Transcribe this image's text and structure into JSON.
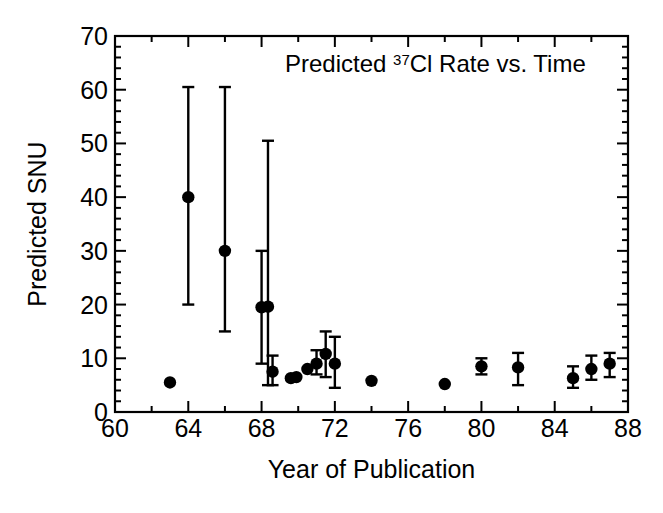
{
  "figure": {
    "title_prefix": "Predicted ",
    "title_sup": "37",
    "title_suffix": "Cl Rate vs. Time",
    "xlabel": "Year of Publication",
    "ylabel": "Predicted SNU",
    "ink_color": "#000000",
    "background_color": "#ffffff"
  },
  "chart_data": {
    "type": "scatter",
    "title": "Predicted 37Cl Rate vs. Time",
    "xlabel": "Year of Publication",
    "ylabel": "Predicted SNU",
    "xlim": [
      60,
      88
    ],
    "ylim": [
      0,
      70
    ],
    "xticks": [
      60,
      62,
      64,
      66,
      68,
      70,
      72,
      74,
      76,
      78,
      80,
      82,
      84,
      86,
      88
    ],
    "xtick_labels": [
      "60",
      "",
      "64",
      "",
      "68",
      "",
      "72",
      "",
      "76",
      "",
      "80",
      "",
      "84",
      "",
      "88"
    ],
    "yticks": [
      0,
      10,
      20,
      30,
      40,
      50,
      60,
      70
    ],
    "ytick_labels": [
      "0",
      "10",
      "20",
      "30",
      "40",
      "50",
      "60",
      "70"
    ],
    "x_minor_tick_interval": 2,
    "y_minor_tick_interval": 2,
    "grid": false,
    "legend": false,
    "marker": "filled-circle",
    "errorbars": "vertical-with-caps",
    "points": [
      {
        "x": 63.0,
        "y": 5.5,
        "ylow": null,
        "yhigh": null
      },
      {
        "x": 64.0,
        "y": 40.0,
        "ylow": 20.0,
        "yhigh": 60.5
      },
      {
        "x": 66.0,
        "y": 30.0,
        "ylow": 15.0,
        "yhigh": 60.5
      },
      {
        "x": 68.0,
        "y": 19.5,
        "ylow": 9.0,
        "yhigh": 30.0
      },
      {
        "x": 68.35,
        "y": 19.6,
        "ylow": 5.0,
        "yhigh": 50.5
      },
      {
        "x": 68.6,
        "y": 7.5,
        "ylow": 5.0,
        "yhigh": 10.5
      },
      {
        "x": 69.6,
        "y": 6.3,
        "ylow": null,
        "yhigh": null
      },
      {
        "x": 69.9,
        "y": 6.5,
        "ylow": null,
        "yhigh": null
      },
      {
        "x": 70.5,
        "y": 8.0,
        "ylow": null,
        "yhigh": null
      },
      {
        "x": 71.0,
        "y": 9.0,
        "ylow": 7.0,
        "yhigh": 11.5
      },
      {
        "x": 71.5,
        "y": 10.8,
        "ylow": 6.5,
        "yhigh": 15.0
      },
      {
        "x": 72.0,
        "y": 9.0,
        "ylow": 4.5,
        "yhigh": 14.0
      },
      {
        "x": 74.0,
        "y": 5.8,
        "ylow": null,
        "yhigh": null
      },
      {
        "x": 78.0,
        "y": 5.2,
        "ylow": null,
        "yhigh": null
      },
      {
        "x": 80.0,
        "y": 8.5,
        "ylow": 7.0,
        "yhigh": 10.0
      },
      {
        "x": 82.0,
        "y": 8.3,
        "ylow": 5.0,
        "yhigh": 11.0
      },
      {
        "x": 85.0,
        "y": 6.3,
        "ylow": 4.5,
        "yhigh": 8.5
      },
      {
        "x": 86.0,
        "y": 8.0,
        "ylow": 6.0,
        "yhigh": 10.5
      },
      {
        "x": 87.0,
        "y": 9.0,
        "ylow": 6.5,
        "yhigh": 11.0
      }
    ]
  }
}
